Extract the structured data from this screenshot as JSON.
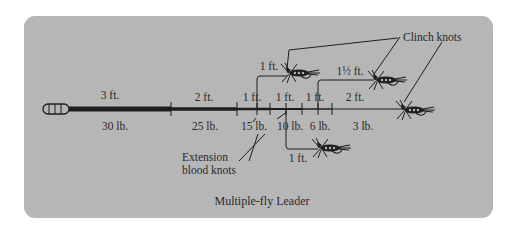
{
  "title": "Multiple-fly Leader",
  "colors": {
    "panel": "#b6b6b6",
    "ink": "#1e1e1e"
  },
  "leader_sections": [
    {
      "length": "3 ft.",
      "strength": "30 lb."
    },
    {
      "length": "2 ft.",
      "strength": "25 lb."
    },
    {
      "length": "1 ft.",
      "strength": "15 lb."
    },
    {
      "length": "1 ft.",
      "strength": "10 lb."
    },
    {
      "length": "1 ft.",
      "strength": "6 lb."
    },
    {
      "length": "2 ft.",
      "strength": "3 lb."
    }
  ],
  "droppers": [
    {
      "length": "1 ft.",
      "position": "upper-left"
    },
    {
      "length": "1½ ft.",
      "position": "upper-right"
    },
    {
      "length": "1 ft.",
      "position": "lower"
    }
  ],
  "labels": {
    "clinch_knots": "Clinch knots",
    "extension_line1": "Extension",
    "extension_line2": "blood knots"
  },
  "icons": [
    "fly-line-loop-icon",
    "fly-icon"
  ]
}
